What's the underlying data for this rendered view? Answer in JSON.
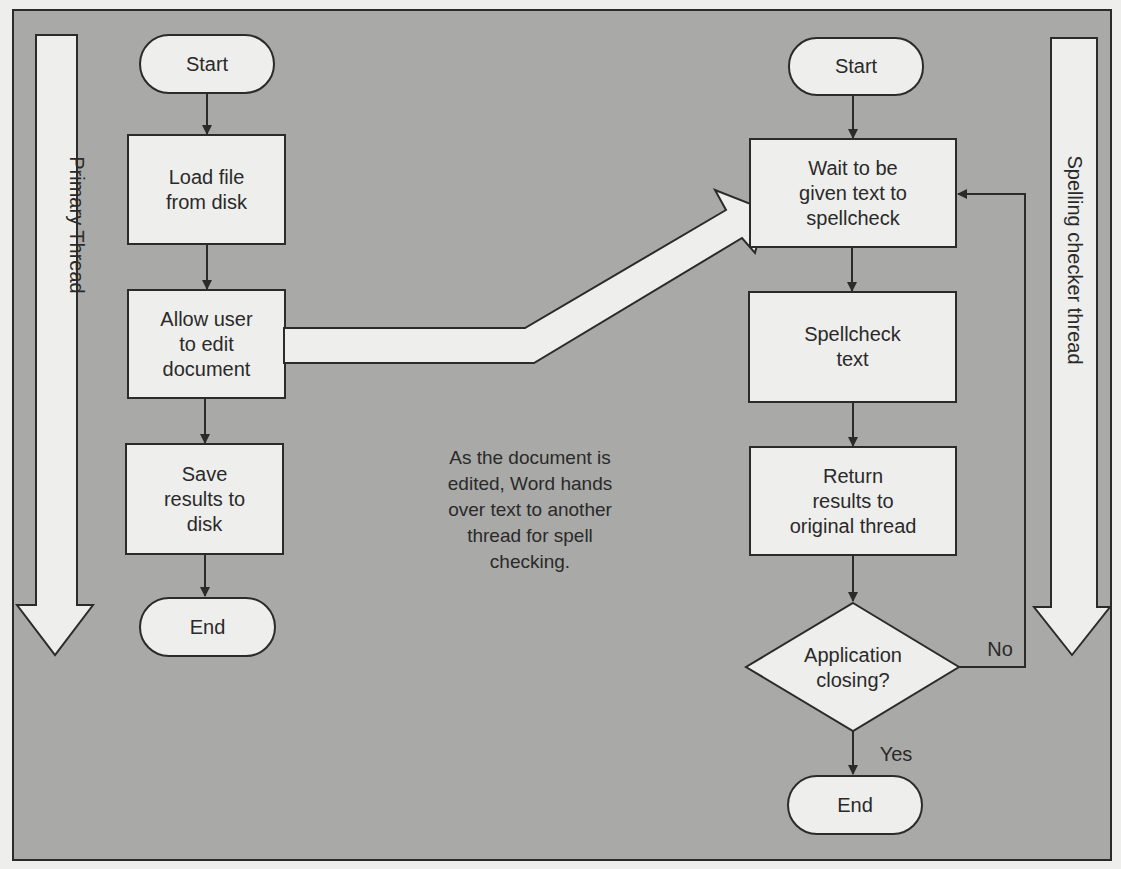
{
  "colors": {
    "panel_bg": "#a9a9a7",
    "shape_fill": "#eeeeec",
    "stroke": "#2b2b2b",
    "text": "#2a2a2a"
  },
  "lanes": {
    "primary": {
      "label": "Primary Thread"
    },
    "spelling": {
      "label": "Spelling checker thread"
    }
  },
  "primary_flow": {
    "start": "Start",
    "load": "Load file\nfrom disk",
    "edit": "Allow user\nto edit\ndocument",
    "save": "Save\nresults to\ndisk",
    "end": "End"
  },
  "spell_flow": {
    "start": "Start",
    "wait": "Wait to be\ngiven text to\nspellcheck",
    "check": "Spellcheck\ntext",
    "return": "Return\nresults to\noriginal thread",
    "decision": "Application\nclosing?",
    "no_label": "No",
    "yes_label": "Yes",
    "end": "End"
  },
  "annotation": "As the document is\nedited, Word hands\nover text to another\nthread for spell\nchecking."
}
